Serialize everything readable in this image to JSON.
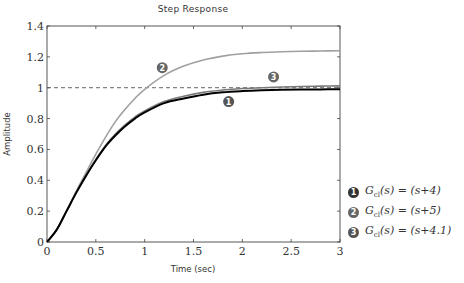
{
  "chart_data": {
    "type": "line",
    "title": "Step Response",
    "xlabel": "Time (sec)",
    "ylabel": "Amplitude",
    "xlim": [
      0,
      3
    ],
    "ylim": [
      0,
      1.4
    ],
    "xticks": [
      0,
      0.5,
      1,
      1.5,
      2,
      2.5,
      3
    ],
    "xtick_labels": [
      "0",
      "0.5",
      "1",
      "1.5",
      "2",
      "2.5",
      "3"
    ],
    "yticks": [
      0,
      0.2,
      0.4,
      0.6,
      0.8,
      1,
      1.2,
      1.4
    ],
    "ytick_labels": [
      "0",
      "0.2",
      "0.4",
      "0.6",
      "0.8",
      "1",
      "1.2",
      "1.4"
    ],
    "grid": false,
    "reference_line": {
      "y": 1.0,
      "style": "dashed"
    },
    "x": [
      0,
      0.1,
      0.2,
      0.3,
      0.4,
      0.5,
      0.6,
      0.7,
      0.8,
      0.9,
      1.0,
      1.2,
      1.4,
      1.6,
      1.8,
      2.0,
      2.2,
      2.4,
      2.6,
      2.8,
      3.0
    ],
    "series": [
      {
        "name": "1",
        "label": "G_cl(s) = (s+4)",
        "color": "#000000",
        "values": [
          0,
          0.08,
          0.2,
          0.32,
          0.43,
          0.53,
          0.62,
          0.69,
          0.75,
          0.8,
          0.84,
          0.9,
          0.93,
          0.955,
          0.97,
          0.978,
          0.983,
          0.986,
          0.988,
          0.989,
          0.99
        ]
      },
      {
        "name": "2",
        "label": "G_cl(s) = (s+5)",
        "color": "#a0a0a0",
        "values": [
          0,
          0.08,
          0.2,
          0.33,
          0.45,
          0.57,
          0.68,
          0.78,
          0.86,
          0.93,
          0.99,
          1.08,
          1.14,
          1.18,
          1.205,
          1.22,
          1.228,
          1.233,
          1.236,
          1.238,
          1.24
        ]
      },
      {
        "name": "3",
        "label": "G_cl(s) = (s+4.1)",
        "color": "#7a7a7a",
        "values": [
          0,
          0.08,
          0.2,
          0.32,
          0.43,
          0.535,
          0.625,
          0.7,
          0.76,
          0.81,
          0.85,
          0.91,
          0.945,
          0.97,
          0.985,
          0.995,
          1.0,
          1.005,
          1.008,
          1.01,
          1.012
        ]
      }
    ],
    "annotations": [
      {
        "marker": "2",
        "x": 1.18,
        "y": 1.13
      },
      {
        "marker": "3",
        "x": 2.32,
        "y": 1.07
      },
      {
        "marker": "1",
        "x": 1.86,
        "y": 0.91
      }
    ],
    "legend_position": "right"
  },
  "legend": {
    "items": [
      {
        "marker": "1",
        "fn": "G",
        "sub": "cl",
        "arg": "(s)",
        "rhs": "= (s+4)",
        "color": "#333333"
      },
      {
        "marker": "2",
        "fn": "G",
        "sub": "cl",
        "arg": "(s)",
        "rhs": "= (s+5)",
        "color": "#666666"
      },
      {
        "marker": "3",
        "fn": "G",
        "sub": "cl",
        "arg": "(s)",
        "rhs": "= (s+4.1)",
        "color": "#555555"
      }
    ]
  }
}
